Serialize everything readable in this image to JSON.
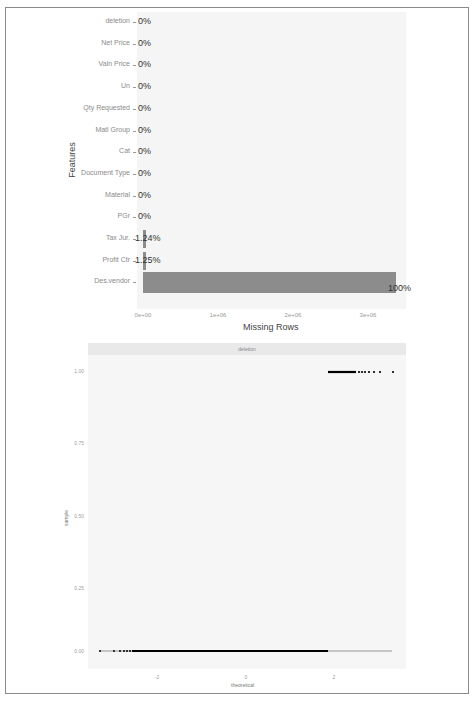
{
  "chart_data": [
    {
      "type": "bar",
      "orientation": "horizontal",
      "title": "",
      "xlabel": "Missing Rows",
      "ylabel": "Features",
      "categories": [
        "deletion",
        "Net Price",
        "Valn Price",
        "Un",
        "Qty Requested",
        "Matl Group",
        "Cat",
        "Document Type",
        "Material",
        "PGr",
        "Tax Jur.",
        "Profit Ctr",
        "Des.vendor"
      ],
      "values_pct": [
        0,
        0,
        0,
        0,
        0,
        0,
        0,
        0,
        0,
        0,
        1.24,
        1.25,
        100
      ],
      "labels": [
        "0%",
        "0%",
        "0%",
        "0%",
        "0%",
        "0%",
        "0%",
        "0%",
        "0%",
        "0%",
        "1.24%",
        "1.25%",
        "100%"
      ],
      "values": [
        0,
        0,
        0,
        0,
        0,
        0,
        0,
        0,
        0,
        0,
        42000,
        42300,
        3380000
      ],
      "x_ticks": [
        "0e+00",
        "1e+06",
        "2e+06",
        "3e+06"
      ],
      "xlim": [
        0,
        3500000
      ],
      "bar_color": "#8c8c8c",
      "grid": false
    },
    {
      "type": "scatter",
      "subtype": "qq-plot",
      "facet_label": "deletion",
      "xlabel": "theoretical",
      "ylabel": "sample",
      "x_ticks": [
        "-2",
        "0",
        "2"
      ],
      "y_ticks": [
        "0.00",
        "0.25",
        "0.50",
        "0.75",
        "1.00"
      ],
      "ylim": [
        0,
        1
      ],
      "xlim": [
        -4.5,
        4.5
      ],
      "series": [
        {
          "name": "sample = 0",
          "y": 0,
          "x_range": [
            -4.3,
            2.1
          ],
          "note": "dense points from x≈-3.7 to x≈2.1, with line continuing to ≈4.3"
        },
        {
          "name": "sample = 1",
          "y": 1,
          "x_range": [
            2.1,
            4.2
          ],
          "note": "dense points from x≈2.1 thinning toward x≈4.2"
        }
      ],
      "point_color": "#000000"
    }
  ],
  "bar_chart": {
    "ylabel": "Features",
    "xlabel": "Missing Rows",
    "rows": [
      {
        "label": "deletion",
        "pct": "0%"
      },
      {
        "label": "Net Price",
        "pct": "0%"
      },
      {
        "label": "Valn Price",
        "pct": "0%"
      },
      {
        "label": "Un",
        "pct": "0%"
      },
      {
        "label": "Qty Requested",
        "pct": "0%"
      },
      {
        "label": "Matl Group",
        "pct": "0%"
      },
      {
        "label": "Cat",
        "pct": "0%"
      },
      {
        "label": "Document Type",
        "pct": "0%"
      },
      {
        "label": "Material",
        "pct": "0%"
      },
      {
        "label": "PGr",
        "pct": "0%"
      },
      {
        "label": "Tax Jur.",
        "pct": "1.24%"
      },
      {
        "label": "Profit Ctr",
        "pct": "1.25%"
      },
      {
        "label": "Des.vendor",
        "pct": "100%"
      }
    ],
    "x_ticks": [
      "0e+00",
      "1e+06",
      "2e+06",
      "3e+06"
    ]
  },
  "qq_chart": {
    "strip": "deletion",
    "xlabel": "theoretical",
    "ylabel": "sample",
    "y_ticks": [
      "1.00",
      "0.75",
      "0.50",
      "0.25",
      "0.00"
    ],
    "x_ticks": [
      "-2",
      "0",
      "2"
    ]
  }
}
